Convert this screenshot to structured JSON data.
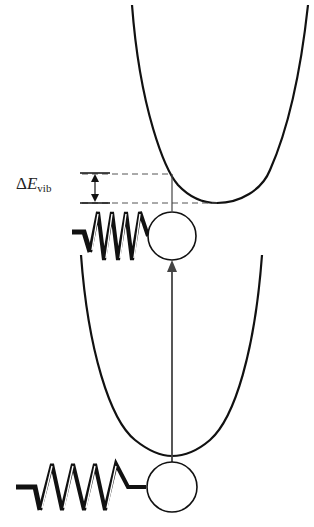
{
  "diagram": {
    "label": {
      "delta": "Δ",
      "symbol": "E",
      "subscript": "vib"
    },
    "upper_well": {
      "name": "excited-state potential",
      "minimum_x": 217,
      "minimum_y": 203
    },
    "lower_well": {
      "name": "ground-state potential",
      "minimum_x": 172,
      "minimum_y": 455
    },
    "transition": {
      "name": "vertical excitation arrow",
      "from_y": 455,
      "to_y": 262
    },
    "colors": {
      "line": "#111111",
      "arrow": "#444444",
      "dashes": "#555555"
    }
  }
}
